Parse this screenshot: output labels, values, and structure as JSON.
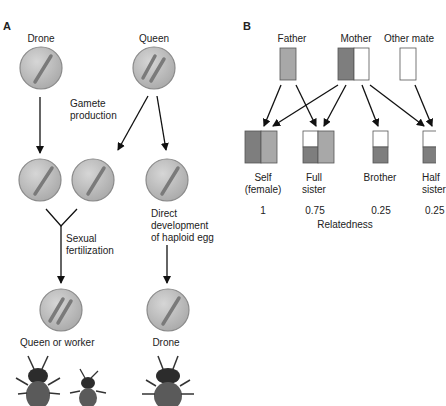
{
  "panel_a": {
    "label": "A",
    "drone_label": "Drone",
    "queen_label": "Queen",
    "gamete_production": [
      "Gamete",
      "production"
    ],
    "sexual_fertilization": [
      "Sexual",
      "fertilization"
    ],
    "direct_development": [
      "Direct",
      "development",
      "of haploid egg"
    ],
    "result_left": "Queen or worker",
    "result_right": "Drone"
  },
  "panel_b": {
    "label": "B",
    "parents": [
      "Father",
      "Mother",
      "Other mate"
    ],
    "offspring": [
      {
        "name": [
          "Self",
          "(female)"
        ],
        "relatedness": "1"
      },
      {
        "name": [
          "Full",
          "sister"
        ],
        "relatedness": "0.75"
      },
      {
        "name": [
          "Brother",
          ""
        ],
        "relatedness": "0.25"
      },
      {
        "name": [
          "Half",
          "sister"
        ],
        "relatedness": "0.25"
      }
    ],
    "axis_label": "Relatedness"
  },
  "colors": {
    "cell_fill": "#bdbdbd",
    "cell_stroke": "#8a8a8a",
    "chromosome": "#7a7a7a",
    "father_gray": "#a8a8a8",
    "mother_dark": "#7e7e7e",
    "white": "#ffffff"
  }
}
